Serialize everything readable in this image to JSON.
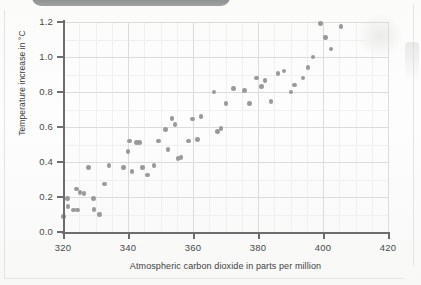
{
  "document": {
    "artifact_top_bar": "scanner-shadow-bar"
  },
  "chart_data": {
    "type": "scatter",
    "title": "",
    "xlabel": "Atmospheric carbon dioxide in parts per million",
    "ylabel": "Temperature increase in °C",
    "xlim": [
      320,
      420
    ],
    "ylim": [
      0.0,
      1.2
    ],
    "xticks": [
      320,
      340,
      360,
      380,
      400,
      420
    ],
    "yticks": [
      "0.0",
      "0.2",
      "0.4",
      "0.6",
      "0.8",
      "1.0",
      "1.2"
    ],
    "grid": true,
    "grid_minor_x_step": 5,
    "grid_minor_y_step": 0.1,
    "legend": "none",
    "marker_color": "#9a9a9a",
    "marker_size_px": 4.6,
    "points": [
      {
        "x": 320.2,
        "y": 0.09
      },
      {
        "x": 321.3,
        "y": 0.19
      },
      {
        "x": 321.6,
        "y": 0.145
      },
      {
        "x": 323.2,
        "y": 0.125
      },
      {
        "x": 324.1,
        "y": 0.245
      },
      {
        "x": 324.4,
        "y": 0.125
      },
      {
        "x": 325.2,
        "y": 0.225
      },
      {
        "x": 326.4,
        "y": 0.22
      },
      {
        "x": 327.9,
        "y": 0.37
      },
      {
        "x": 329.3,
        "y": 0.19
      },
      {
        "x": 329.6,
        "y": 0.13
      },
      {
        "x": 331.2,
        "y": 0.1
      },
      {
        "x": 332.7,
        "y": 0.275
      },
      {
        "x": 334.2,
        "y": 0.38
      },
      {
        "x": 338.6,
        "y": 0.37
      },
      {
        "x": 340.0,
        "y": 0.46
      },
      {
        "x": 340.5,
        "y": 0.52
      },
      {
        "x": 341.2,
        "y": 0.345
      },
      {
        "x": 342.6,
        "y": 0.51
      },
      {
        "x": 343.5,
        "y": 0.51
      },
      {
        "x": 344.5,
        "y": 0.37
      },
      {
        "x": 346.0,
        "y": 0.325
      },
      {
        "x": 348.0,
        "y": 0.38
      },
      {
        "x": 349.4,
        "y": 0.52
      },
      {
        "x": 351.6,
        "y": 0.585
      },
      {
        "x": 352.3,
        "y": 0.47
      },
      {
        "x": 353.6,
        "y": 0.65
      },
      {
        "x": 354.4,
        "y": 0.615
      },
      {
        "x": 355.4,
        "y": 0.42
      },
      {
        "x": 356.3,
        "y": 0.425
      },
      {
        "x": 358.6,
        "y": 0.52
      },
      {
        "x": 359.8,
        "y": 0.645
      },
      {
        "x": 361.4,
        "y": 0.53
      },
      {
        "x": 362.4,
        "y": 0.66
      },
      {
        "x": 366.5,
        "y": 0.8
      },
      {
        "x": 367.6,
        "y": 0.575
      },
      {
        "x": 368.6,
        "y": 0.59
      },
      {
        "x": 370.2,
        "y": 0.735
      },
      {
        "x": 372.5,
        "y": 0.82
      },
      {
        "x": 375.8,
        "y": 0.81
      },
      {
        "x": 377.4,
        "y": 0.735
      },
      {
        "x": 379.5,
        "y": 0.88
      },
      {
        "x": 381.0,
        "y": 0.83
      },
      {
        "x": 382.2,
        "y": 0.865
      },
      {
        "x": 384.0,
        "y": 0.745
      },
      {
        "x": 386.2,
        "y": 0.905
      },
      {
        "x": 388.0,
        "y": 0.92
      },
      {
        "x": 390.2,
        "y": 0.8
      },
      {
        "x": 391.2,
        "y": 0.84
      },
      {
        "x": 393.8,
        "y": 0.88
      },
      {
        "x": 395.4,
        "y": 0.94
      },
      {
        "x": 396.9,
        "y": 1.0
      },
      {
        "x": 399.2,
        "y": 1.19
      },
      {
        "x": 400.8,
        "y": 1.11
      },
      {
        "x": 402.5,
        "y": 1.045
      },
      {
        "x": 405.6,
        "y": 1.175
      }
    ]
  }
}
